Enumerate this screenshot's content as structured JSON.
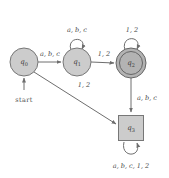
{
  "figure": {
    "type": "finite-state-automaton-diagram",
    "background_color": "#ffffff",
    "stroke_color": "#6e6e6e",
    "node_fill_light": "#cccccc",
    "node_fill_dark": "#b3b3b3",
    "start_label": "start"
  },
  "states": [
    {
      "id": "q0",
      "label": "q",
      "subscript": "0",
      "shape": "circle",
      "accepting": false,
      "start": true,
      "cx": 24,
      "cy": 62,
      "r": 14
    },
    {
      "id": "q1",
      "label": "q",
      "subscript": "1",
      "shape": "circle",
      "accepting": false,
      "start": false,
      "cx": 77,
      "cy": 62,
      "r": 14
    },
    {
      "id": "q2",
      "label": "q",
      "subscript": "2",
      "shape": "double-circle",
      "accepting": true,
      "start": false,
      "cx": 131,
      "cy": 63,
      "r": 15,
      "inner_r": 11
    },
    {
      "id": "q3",
      "label": "q",
      "subscript": "3",
      "shape": "square",
      "accepting": false,
      "start": false,
      "cx": 131,
      "cy": 128,
      "size": 25
    }
  ],
  "transitions": [
    {
      "id": "t0",
      "from": "q0",
      "to": "q1",
      "label": "a, b, c",
      "kind": "straight",
      "label_x": 50,
      "label_y": 54
    },
    {
      "id": "t1",
      "from": "q1",
      "to": "q1",
      "label": "a, b, c",
      "kind": "self-loop",
      "label_x": 77,
      "label_y": 30
    },
    {
      "id": "t2",
      "from": "q1",
      "to": "q2",
      "label": "1, 2",
      "kind": "straight",
      "label_x": 104,
      "label_y": 54
    },
    {
      "id": "t3",
      "from": "q2",
      "to": "q2",
      "label": "1, 2",
      "kind": "self-loop",
      "label_x": 132,
      "label_y": 30
    },
    {
      "id": "t4",
      "from": "q0",
      "to": "q3",
      "label": "1, 2",
      "kind": "straight",
      "label_x": 84,
      "label_y": 85
    },
    {
      "id": "t5",
      "from": "q2",
      "to": "q3",
      "label": "a, b, c",
      "kind": "straight",
      "label_x": 147,
      "label_y": 98
    },
    {
      "id": "t6",
      "from": "q3",
      "to": "q3",
      "label": "a, b, c, 1, 2",
      "kind": "self-loop",
      "label_x": 131,
      "label_y": 166
    }
  ]
}
